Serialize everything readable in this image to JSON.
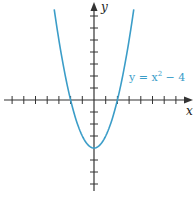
{
  "chart_data": {
    "type": "line",
    "title": "",
    "xlabel": "x",
    "ylabel": "y",
    "series": [
      {
        "name": "y = x² − 4",
        "function": "x^2 - 4",
        "x": [
          -3.4,
          -3,
          -2.5,
          -2,
          -1.5,
          -1,
          -0.5,
          0,
          0.5,
          1,
          1.5,
          2,
          2.5,
          3,
          3.4
        ],
        "values": [
          7.56,
          5,
          2.25,
          0,
          -1.75,
          -3,
          -3.75,
          -4,
          -3.75,
          -3,
          -1.75,
          0,
          2.25,
          5,
          7.56
        ]
      }
    ],
    "xlim": [
      -8,
      8.5
    ],
    "ylim": [
      -7.5,
      8.3
    ],
    "x_ticks": [
      -7,
      -6,
      -5,
      -4,
      -3,
      -2,
      -1,
      1,
      2,
      3,
      4,
      5,
      6,
      7
    ],
    "y_ticks": [
      -7,
      -6,
      -5,
      -3,
      -2,
      -1,
      1,
      2,
      3,
      4,
      5,
      6,
      7
    ],
    "tick_labels_shown": false,
    "grid": false,
    "annotations": [
      {
        "text": "y = x² − 4",
        "x": 3.0,
        "y": 2.0
      }
    ],
    "colors": {
      "curve": "#3b9dc8",
      "axes": "#333333",
      "annotation": "#3b9dc8"
    }
  },
  "labels": {
    "x_axis": "x",
    "y_axis": "y",
    "equation_prefix": "y = x",
    "equation_exp": "2",
    "equation_suffix": " − 4"
  }
}
